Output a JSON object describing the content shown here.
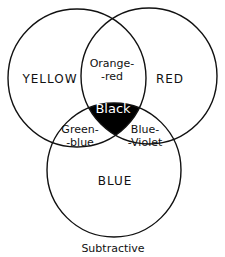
{
  "diagram": {
    "type": "venn",
    "title": "Subtractive",
    "sets": [
      {
        "name": "YELLOW",
        "cx": 77,
        "cy": 78,
        "r": 69
      },
      {
        "name": "RED",
        "cx": 149,
        "cy": 76,
        "r": 68
      },
      {
        "name": "BLUE",
        "cx": 114,
        "cy": 170,
        "r": 67
      }
    ],
    "intersections": [
      {
        "sets": [
          "YELLOW",
          "RED"
        ],
        "label_line1": "Orange-",
        "label_line2": "-red"
      },
      {
        "sets": [
          "YELLOW",
          "BLUE"
        ],
        "label_line1": "Green-",
        "label_line2": "-blue"
      },
      {
        "sets": [
          "RED",
          "BLUE"
        ],
        "label_line1": "Blue-",
        "label_line2": "-Violet"
      },
      {
        "sets": [
          "YELLOW",
          "RED",
          "BLUE"
        ],
        "label": "Black",
        "fill": "#000000"
      }
    ],
    "colors": {
      "stroke": "#111111",
      "center_fill": "#000000",
      "background": "#ffffff"
    }
  }
}
